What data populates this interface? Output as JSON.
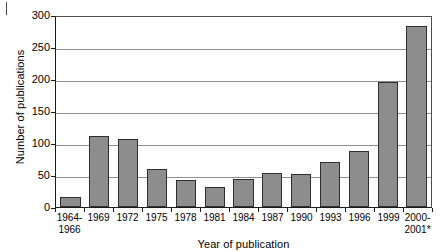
{
  "chart_data": {
    "type": "bar",
    "title": "",
    "xlabel": "Year of publication",
    "ylabel": "Number of publications",
    "ylim": [
      0,
      300
    ],
    "ytick_step": 50,
    "yticks": [
      0,
      50,
      100,
      150,
      200,
      250,
      300
    ],
    "grid": true,
    "legend": null,
    "bar_color": "#8d8d8d",
    "bar_edge_color": "#2e2e2e",
    "gridline_color": "#8f8f8f",
    "axis_color": "#1c1c1c",
    "footnote_marker": "*",
    "categories": [
      "1964-\n1966",
      "1969",
      "1972",
      "1975",
      "1978",
      "1981",
      "1984",
      "1987",
      "1990",
      "1993",
      "1996",
      "1999",
      "2000-\n2001*"
    ],
    "values": [
      16,
      111,
      107,
      60,
      42,
      31,
      44,
      53,
      52,
      70,
      88,
      196,
      283
    ]
  }
}
